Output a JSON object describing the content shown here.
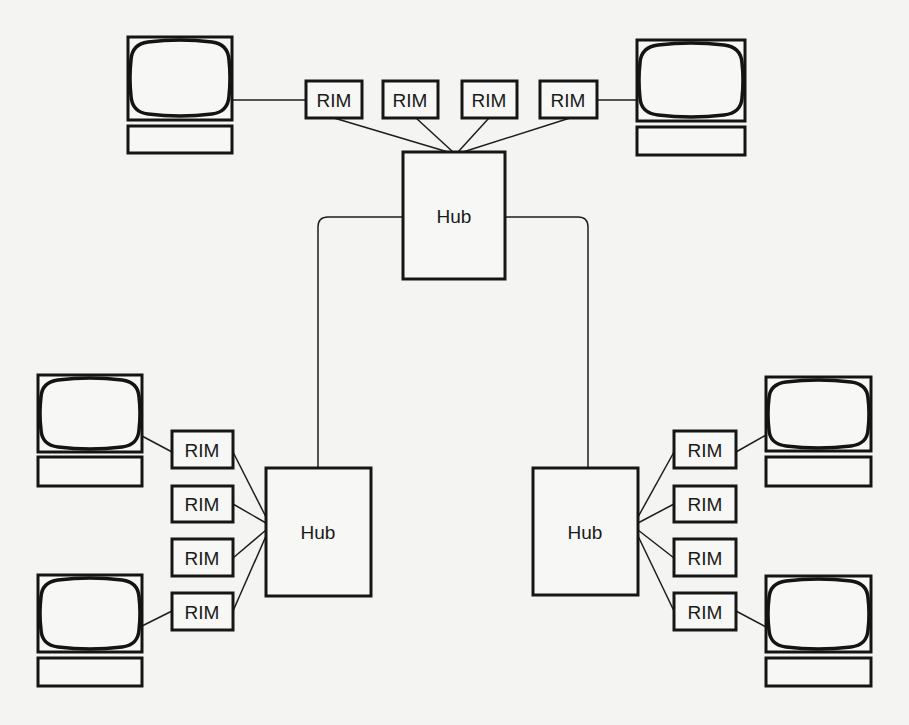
{
  "diagram": {
    "type": "network-topology",
    "background": "#f4f4f2",
    "line_color": "#161616",
    "hubs": [
      {
        "id": "hub-top",
        "label": "Hub",
        "x": 403,
        "y": 152,
        "w": 102,
        "h": 127
      },
      {
        "id": "hub-left",
        "label": "Hub",
        "x": 266,
        "y": 468,
        "w": 105,
        "h": 128
      },
      {
        "id": "hub-right",
        "label": "Hub",
        "x": 533,
        "y": 468,
        "w": 105,
        "h": 127
      }
    ],
    "rims": [
      {
        "id": "rim-top-1",
        "label": "RIM",
        "hub": "hub-top",
        "x": 306,
        "y": 81,
        "w": 56,
        "h": 37
      },
      {
        "id": "rim-top-2",
        "label": "RIM",
        "hub": "hub-top",
        "x": 383,
        "y": 81,
        "w": 55,
        "h": 37
      },
      {
        "id": "rim-top-3",
        "label": "RIM",
        "hub": "hub-top",
        "x": 462,
        "y": 81,
        "w": 55,
        "h": 37
      },
      {
        "id": "rim-top-4",
        "label": "RIM",
        "hub": "hub-top",
        "x": 540,
        "y": 81,
        "w": 57,
        "h": 37
      },
      {
        "id": "rim-left-1",
        "label": "RIM",
        "hub": "hub-left",
        "x": 172,
        "y": 431,
        "w": 61,
        "h": 37
      },
      {
        "id": "rim-left-2",
        "label": "RIM",
        "hub": "hub-left",
        "x": 172,
        "y": 486,
        "w": 61,
        "h": 36
      },
      {
        "id": "rim-left-3",
        "label": "RIM",
        "hub": "hub-left",
        "x": 172,
        "y": 539,
        "w": 61,
        "h": 37
      },
      {
        "id": "rim-left-4",
        "label": "RIM",
        "hub": "hub-left",
        "x": 172,
        "y": 593,
        "w": 61,
        "h": 37
      },
      {
        "id": "rim-right-1",
        "label": "RIM",
        "hub": "hub-right",
        "x": 674,
        "y": 431,
        "w": 62,
        "h": 37
      },
      {
        "id": "rim-right-2",
        "label": "RIM",
        "hub": "hub-right",
        "x": 674,
        "y": 486,
        "w": 62,
        "h": 36
      },
      {
        "id": "rim-right-3",
        "label": "RIM",
        "hub": "hub-right",
        "x": 674,
        "y": 539,
        "w": 62,
        "h": 37
      },
      {
        "id": "rim-right-4",
        "label": "RIM",
        "hub": "hub-right",
        "x": 674,
        "y": 593,
        "w": 62,
        "h": 37
      }
    ],
    "terminals": [
      {
        "id": "terminal-top-left",
        "rim": "rim-top-1",
        "x": 128,
        "y": 37,
        "w": 104,
        "h": 83,
        "base_y": 126,
        "base_h": 27
      },
      {
        "id": "terminal-top-right",
        "rim": "rim-top-4",
        "x": 637,
        "y": 40,
        "w": 108,
        "h": 81,
        "base_y": 127,
        "base_h": 28
      },
      {
        "id": "terminal-left-upper",
        "rim": "rim-left-1",
        "x": 38,
        "y": 375,
        "w": 104,
        "h": 77,
        "base_y": 457,
        "base_h": 29
      },
      {
        "id": "terminal-left-lower",
        "rim": "rim-left-4",
        "x": 38,
        "y": 575,
        "w": 104,
        "h": 77,
        "base_y": 658,
        "base_h": 28
      },
      {
        "id": "terminal-right-upper",
        "rim": "rim-right-1",
        "x": 766,
        "y": 377,
        "w": 105,
        "h": 74,
        "base_y": 457,
        "base_h": 29
      },
      {
        "id": "terminal-right-lower",
        "rim": "rim-right-4",
        "x": 766,
        "y": 576,
        "w": 105,
        "h": 76,
        "base_y": 658,
        "base_h": 28
      }
    ],
    "trunks": [
      {
        "from": "hub-top",
        "to": "hub-left",
        "corner_x": 318,
        "y": 217
      },
      {
        "from": "hub-top",
        "to": "hub-right",
        "corner_x": 588,
        "y": 217
      }
    ]
  }
}
